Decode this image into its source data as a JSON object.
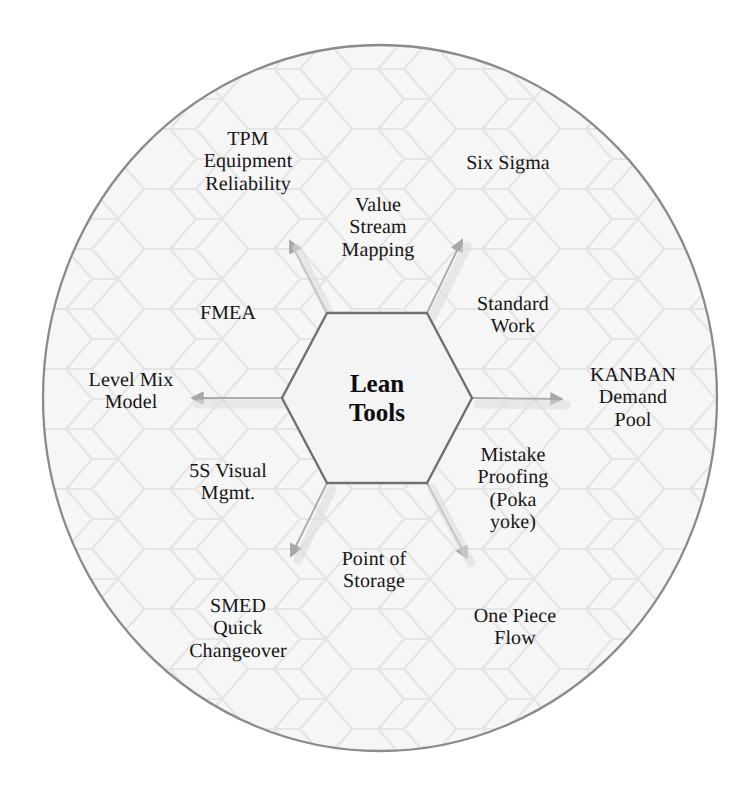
{
  "diagram": {
    "title": "Lean Tools",
    "type": "hexagon-hub-and-spoke",
    "core": {
      "label": "Lean\nTools",
      "shape": "hexagon",
      "center": [
        377,
        398
      ]
    },
    "boundary": {
      "shape": "circle",
      "center": [
        380,
        398
      ],
      "rx": 338,
      "ry": 354,
      "stroke": "#8a8a8a",
      "fill": "#f7f7f7"
    },
    "colors": {
      "ink": "#161616",
      "hex_stroke": "#6f6f76",
      "arrow": "#a9a9ad",
      "background_hex": "#ececec",
      "page_background": "#ffffff"
    },
    "tools": [
      {
        "id": "tpm",
        "label": "TPM\nEquipment\nReliability",
        "x": 248,
        "y": 162
      },
      {
        "id": "six-sigma",
        "label": "Six Sigma",
        "x": 508,
        "y": 163
      },
      {
        "id": "value-stream",
        "label": "Value\nStream\nMapping",
        "x": 378,
        "y": 228
      },
      {
        "id": "fmea",
        "label": "FMEA",
        "x": 228,
        "y": 313
      },
      {
        "id": "standard-work",
        "label": "Standard\nWork",
        "x": 513,
        "y": 315
      },
      {
        "id": "level-mix",
        "label": "Level Mix\nModel",
        "x": 131,
        "y": 391
      },
      {
        "id": "kanban",
        "label": "KANBAN\nDemand\nPool",
        "x": 633,
        "y": 398
      },
      {
        "id": "five-s",
        "label": "5S Visual\nMgmt.",
        "x": 228,
        "y": 482
      },
      {
        "id": "mistake-proof",
        "label": "Mistake\nProofing\n(Poka\nyoke)",
        "x": 513,
        "y": 489
      },
      {
        "id": "point-of-storage",
        "label": "Point of\nStorage",
        "x": 374,
        "y": 570
      },
      {
        "id": "smed",
        "label": "SMED\nQuick\nChangeover",
        "x": 238,
        "y": 629
      },
      {
        "id": "one-piece-flow",
        "label": "One Piece\nFlow",
        "x": 515,
        "y": 627
      }
    ],
    "arrows": [
      {
        "id": "arrow-up-left",
        "from": [
          327,
          313
        ],
        "to": [
          288,
          238
        ]
      },
      {
        "id": "arrow-up-right",
        "from": [
          427,
          313
        ],
        "to": [
          464,
          237
        ]
      },
      {
        "id": "arrow-left",
        "from": [
          282,
          398
        ],
        "to": [
          188,
          398
        ]
      },
      {
        "id": "arrow-right",
        "from": [
          472,
          398
        ],
        "to": [
          566,
          399
        ]
      },
      {
        "id": "arrow-down-left",
        "from": [
          327,
          483
        ],
        "to": [
          288,
          560
        ]
      },
      {
        "id": "arrow-down-right",
        "from": [
          427,
          483
        ],
        "to": [
          470,
          562
        ]
      }
    ]
  }
}
